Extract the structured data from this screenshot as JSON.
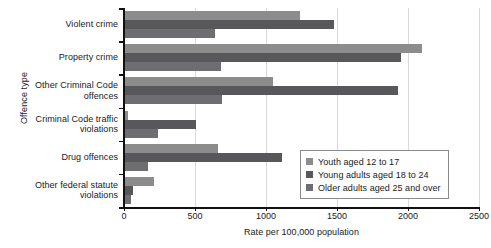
{
  "chart_data": {
    "type": "bar",
    "orientation": "horizontal",
    "title": "",
    "xlabel": "Rate per 100,000 population",
    "ylabel": "Offence type",
    "xlim": [
      0,
      2500
    ],
    "xticks": [
      0,
      500,
      1000,
      1500,
      2000,
      2500
    ],
    "xtick_labels": [
      "0",
      "500",
      "1000",
      "1500",
      "2000",
      "2500"
    ],
    "grid": true,
    "grid_axis": "x",
    "legend_position": "inside-bottom-right",
    "categories": [
      "Violent crime",
      "Property crime",
      "Other Criminal Code offences",
      "Criminal Code traffic violations",
      "Drug offences",
      "Other federal statute violations"
    ],
    "series": [
      {
        "name": "Youth aged 12 to 17",
        "color": "#8c8c8c",
        "values": [
          1240,
          2100,
          1050,
          30,
          660,
          210
        ]
      },
      {
        "name": "Young adults aged 18 to 24",
        "color": "#58585a",
        "values": [
          1480,
          1950,
          1930,
          510,
          1110,
          65
        ]
      },
      {
        "name": "Older adults aged 25 and over",
        "color": "#6e6e70",
        "values": [
          640,
          680,
          690,
          240,
          170,
          50
        ]
      }
    ]
  },
  "legend": {
    "items": [
      {
        "label": "Youth aged 12 to 17",
        "color": "#8c8c8c"
      },
      {
        "label": "Young adults aged 18 to 24",
        "color": "#58585a"
      },
      {
        "label": "Older adults aged 25 and over",
        "color": "#6e6e70"
      }
    ]
  }
}
